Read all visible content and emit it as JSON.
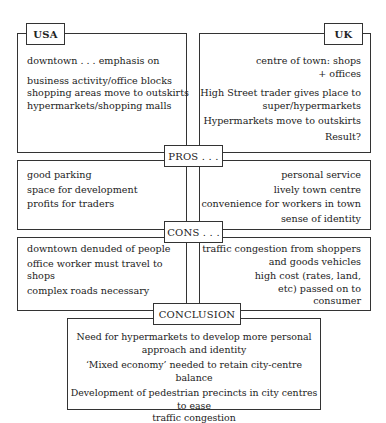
{
  "usa": {
    "title": "USA",
    "lines": [
      "downtown . . . emphasis on",
      "business activity/office blocks",
      "shopping areas move to outskirts",
      "hypermarkets/shopping malls"
    ]
  },
  "uk": {
    "title": "UK",
    "lines": [
      "centre of town: shops",
      "+ offices",
      "High Street trader gives place to",
      "super/hypermarkets",
      "Hypermarkets move to outskirts",
      "Result?"
    ]
  },
  "pros": {
    "title": "PROS . . .",
    "usa": [
      "good parking",
      "space for development",
      "profits for traders"
    ],
    "uk": [
      "personal service",
      "lively town centre",
      "convenience for workers in town",
      "sense of identity"
    ]
  },
  "cons": {
    "title": "CONS . . .",
    "usa": [
      "downtown denuded of people",
      "office worker must travel to",
      "shops",
      "complex roads necessary"
    ],
    "uk": [
      "traffic congestion from shoppers",
      "and goods vehicles",
      "high cost (rates, land,",
      "etc) passed on to",
      "consumer"
    ]
  },
  "conclusion": {
    "title": "CONCLUSION",
    "lines": [
      "Need for hypermarkets to develop more personal",
      "approach and identity",
      "‘Mixed economy’ needed to retain city-centre balance",
      "Development of pedestrian precincts in city centres to ease",
      "traffic congestion"
    ]
  }
}
